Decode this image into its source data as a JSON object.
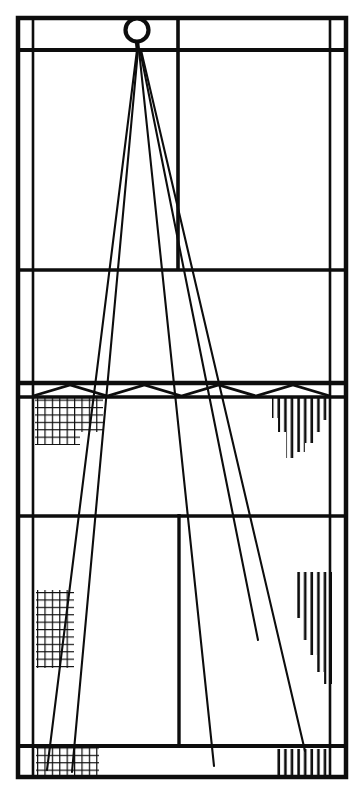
{
  "figure": {
    "type": "line-drawing",
    "width": 360,
    "height": 785,
    "background_color": "#ffffff",
    "ink_color": "#0d0d0d"
  },
  "frame": {
    "outer_rect": {
      "x": 16,
      "y": 16,
      "width": 331,
      "height": 762
    },
    "outer_stroke_width": 4.5,
    "inner_left_x": 33,
    "inner_right_x": 330,
    "inner_stroke_width": 2.6
  },
  "horizontal_rules": [
    {
      "name": "top-band-bottom",
      "y": 50,
      "x1": 16,
      "x2": 347,
      "width": 4.2
    },
    {
      "name": "mid-upper-divider",
      "y": 270,
      "x1": 16,
      "x2": 347,
      "width": 3.4
    },
    {
      "name": "truss-top-chord",
      "y": 383,
      "x1": 16,
      "x2": 347,
      "width": 4.6
    },
    {
      "name": "truss-bottom-chord",
      "y": 397,
      "x1": 16,
      "x2": 347,
      "width": 3.6
    },
    {
      "name": "lower-divider",
      "y": 516,
      "x1": 16,
      "x2": 347,
      "width": 3.4
    },
    {
      "name": "bottom-band-top",
      "y": 746,
      "x1": 16,
      "x2": 347,
      "width": 4.2
    }
  ],
  "vertical_rules": [
    {
      "name": "left-inner-column",
      "x": 33,
      "y1": 16,
      "y2": 778,
      "width": 2.6
    },
    {
      "name": "right-inner-column",
      "x": 330,
      "y1": 16,
      "y2": 778,
      "width": 2.6
    },
    {
      "name": "upper-center-mullion",
      "x": 178,
      "y1": 17,
      "y2": 271,
      "width": 3.6
    },
    {
      "name": "lower-center-mullion",
      "x": 179,
      "y1": 514,
      "y2": 747,
      "width": 3.4
    }
  ],
  "node": {
    "name": "apex-node",
    "circle": {
      "cx": 137,
      "cy": 30,
      "r": 11.5,
      "stroke_width": 4.2
    },
    "vertex": {
      "x": 138,
      "y": 51
    }
  },
  "rays": [
    {
      "name": "ray-1-far-left",
      "x1": 137,
      "y1": 50,
      "x2": 47,
      "y2": 770
    },
    {
      "name": "ray-2-left",
      "x1": 138,
      "y1": 50,
      "x2": 72,
      "y2": 772
    },
    {
      "name": "ray-3-center",
      "x1": 139,
      "y1": 50,
      "x2": 214,
      "y2": 766
    },
    {
      "name": "ray-4-right",
      "x1": 140,
      "y1": 50,
      "x2": 258,
      "y2": 640
    },
    {
      "name": "ray-5-far-right",
      "x1": 141,
      "y1": 50,
      "x2": 305,
      "y2": 751
    }
  ],
  "truss": {
    "name": "zigzag-web",
    "top_y": 385,
    "bottom_y": 396,
    "x_start": 33,
    "x_end": 330,
    "panel_count": 8,
    "stroke_width": 2.8
  },
  "hatch_blocks": [
    {
      "name": "hatch-upper-left-crosshatch",
      "pattern": "crosshatch",
      "x": 35,
      "y": 397,
      "width": 68,
      "height": 42,
      "steps": [
        {
          "x": 35,
          "width": 68,
          "height": 42
        },
        {
          "x": 35,
          "width": 45,
          "height": 48
        }
      ]
    },
    {
      "name": "hatch-upper-right-vertical",
      "pattern": "vertical-stagger",
      "x": 272,
      "y": 397,
      "width": 58,
      "height": 62,
      "descending": true
    },
    {
      "name": "hatch-lower-left-crosshatch",
      "pattern": "crosshatch",
      "x": 36,
      "y": 590,
      "width": 38,
      "height": 78
    },
    {
      "name": "hatch-lower-right-vertical",
      "pattern": "vertical-stagger",
      "x": 294,
      "y": 572,
      "width": 38,
      "height": 112,
      "descending": true
    },
    {
      "name": "hatch-bottom-left-crosshatch",
      "pattern": "crosshatch",
      "x": 36,
      "y": 748,
      "width": 63,
      "height": 30
    },
    {
      "name": "hatch-bottom-right-vertical",
      "pattern": "vertical-stagger",
      "x": 277,
      "y": 749,
      "width": 52,
      "height": 29,
      "descending": false
    }
  ],
  "legend": {
    "crosshatch_label": "crosshatch-fill",
    "vertical_label": "vertical-hatch-fill"
  }
}
